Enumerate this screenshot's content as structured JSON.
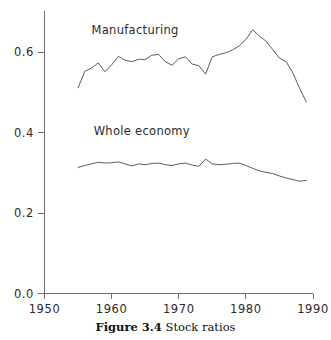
{
  "caption": {
    "label": "Figure 3.4",
    "text": "Stock ratios"
  },
  "chart_data": {
    "type": "line",
    "title": "Stock ratios",
    "xlabel": "",
    "ylabel": "",
    "xlim": [
      1950,
      1990
    ],
    "ylim": [
      0.0,
      0.68
    ],
    "xticks": [
      1950,
      1960,
      1970,
      1980,
      1990
    ],
    "xticklabels": [
      "1950",
      "1960",
      "1970",
      "1980",
      "1990"
    ],
    "yticks": [
      0.0,
      0.2,
      0.4,
      0.6
    ],
    "yticklabels": [
      "0.0",
      "0.2",
      "0.4",
      "0.6"
    ],
    "grid": false,
    "legend_position": "inline-annotation",
    "x": [
      1955,
      1956,
      1957,
      1958,
      1959,
      1960,
      1961,
      1962,
      1963,
      1964,
      1965,
      1966,
      1967,
      1968,
      1969,
      1970,
      1971,
      1972,
      1973,
      1974,
      1975,
      1976,
      1977,
      1978,
      1979,
      1980,
      1981,
      1982,
      1983,
      1984,
      1985,
      1986,
      1987,
      1988,
      1989
    ],
    "series": [
      {
        "name": "Manufacturing",
        "annotation_x": 1963.5,
        "annotation_y": 0.645,
        "values": [
          0.511,
          0.552,
          0.56,
          0.573,
          0.551,
          0.568,
          0.589,
          0.58,
          0.576,
          0.582,
          0.581,
          0.592,
          0.594,
          0.576,
          0.567,
          0.583,
          0.588,
          0.57,
          0.566,
          0.545,
          0.588,
          0.594,
          0.598,
          0.605,
          0.615,
          0.631,
          0.655,
          0.64,
          0.627,
          0.606,
          0.585,
          0.576,
          0.548,
          0.51,
          0.476
        ]
      },
      {
        "name": "Whole economy",
        "annotation_x": 1964.5,
        "annotation_y": 0.393,
        "values": [
          0.313,
          0.318,
          0.322,
          0.326,
          0.324,
          0.325,
          0.327,
          0.322,
          0.317,
          0.322,
          0.32,
          0.323,
          0.324,
          0.32,
          0.318,
          0.322,
          0.324,
          0.319,
          0.316,
          0.334,
          0.322,
          0.32,
          0.321,
          0.323,
          0.324,
          0.318,
          0.311,
          0.305,
          0.301,
          0.298,
          0.292,
          0.287,
          0.283,
          0.279,
          0.281
        ]
      }
    ]
  }
}
